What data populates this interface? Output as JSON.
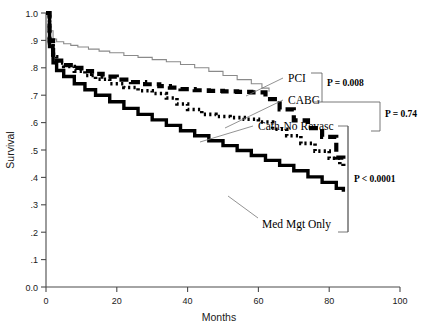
{
  "chart_data": {
    "type": "line",
    "title": "",
    "subtitle": "",
    "xlabel": "Months",
    "ylabel": "Survival",
    "xlim": [
      0,
      100
    ],
    "ylim": [
      0,
      1.0
    ],
    "grid": false,
    "legend_position": "inline-annotations",
    "xticks": [
      "0",
      "20",
      "40",
      "60",
      "80",
      "100"
    ],
    "xtick_values": [
      0,
      20,
      40,
      60,
      80,
      100
    ],
    "yticks": [
      "0.0",
      ".1",
      ".2",
      ".3",
      ".4",
      ".5",
      ".6",
      ".7",
      ".8",
      ".9",
      "1.0"
    ],
    "ytick_values": [
      0.0,
      0.1,
      0.2,
      0.3,
      0.4,
      0.5,
      0.6,
      0.7,
      0.8,
      0.9,
      1.0
    ],
    "series": [
      {
        "name": "PCI",
        "style": "thin-solid",
        "color": "#8a8a8a",
        "x": [
          0,
          1,
          2,
          3,
          5,
          7,
          9,
          12,
          15,
          18,
          22,
          26,
          30,
          34,
          38,
          42,
          46,
          50,
          54,
          58,
          61,
          63
        ],
        "values": [
          1.0,
          0.935,
          0.905,
          0.895,
          0.888,
          0.882,
          0.876,
          0.868,
          0.861,
          0.855,
          0.845,
          0.838,
          0.83,
          0.822,
          0.812,
          0.8,
          0.787,
          0.772,
          0.757,
          0.742,
          0.726,
          0.713
        ]
      },
      {
        "name": "CABG",
        "style": "thick-dashed",
        "color": "#000000",
        "x": [
          0,
          1,
          2,
          3,
          5,
          7,
          10,
          13,
          16,
          20,
          24,
          28,
          32,
          35,
          38,
          42,
          46,
          50,
          54,
          58,
          62,
          66,
          70,
          74,
          78,
          82,
          84
        ],
        "values": [
          1.0,
          0.9,
          0.848,
          0.826,
          0.81,
          0.8,
          0.788,
          0.778,
          0.768,
          0.757,
          0.748,
          0.74,
          0.733,
          0.728,
          0.722,
          0.718,
          0.716,
          0.714,
          0.712,
          0.71,
          0.686,
          0.648,
          0.608,
          0.58,
          0.548,
          0.472,
          0.442
        ]
      },
      {
        "name": "Cath-No Revasc",
        "style": "dotted",
        "color": "#000000",
        "x": [
          0,
          1,
          2,
          3,
          5,
          8,
          11,
          14,
          18,
          22,
          26,
          30,
          34,
          37,
          40,
          44,
          48,
          52,
          56,
          60,
          64,
          68,
          72,
          76,
          80,
          83
        ],
        "values": [
          1.0,
          0.892,
          0.84,
          0.818,
          0.805,
          0.788,
          0.772,
          0.758,
          0.742,
          0.728,
          0.716,
          0.706,
          0.69,
          0.668,
          0.648,
          0.63,
          0.622,
          0.618,
          0.612,
          0.602,
          0.576,
          0.552,
          0.524,
          0.496,
          0.47,
          0.448
        ]
      },
      {
        "name": "Med Mgt Only",
        "style": "thick-solid",
        "color": "#000000",
        "x": [
          0,
          1,
          2,
          3,
          5,
          8,
          11,
          14,
          18,
          22,
          26,
          30,
          34,
          38,
          42,
          46,
          50,
          54,
          58,
          62,
          66,
          70,
          74,
          78,
          82,
          84
        ],
        "values": [
          1.0,
          0.878,
          0.818,
          0.79,
          0.768,
          0.742,
          0.72,
          0.7,
          0.676,
          0.652,
          0.63,
          0.61,
          0.59,
          0.57,
          0.552,
          0.534,
          0.516,
          0.498,
          0.48,
          0.462,
          0.444,
          0.424,
          0.402,
          0.382,
          0.36,
          0.348
        ]
      }
    ],
    "annotations": [
      {
        "text": "PCI",
        "kind": "series-label"
      },
      {
        "text": "CABG",
        "kind": "series-label"
      },
      {
        "text": "Cath-No Revasc",
        "kind": "series-label"
      },
      {
        "text": "Med Mgt Only",
        "kind": "series-label"
      },
      {
        "text": "P = 0.008",
        "kind": "p-value",
        "compares": [
          "PCI",
          "CABG"
        ]
      },
      {
        "text": "P = 0.74",
        "kind": "p-value",
        "compares": [
          "PCI/CABG",
          "Cath-No Revasc"
        ]
      },
      {
        "text": "P < 0.0001",
        "kind": "p-value",
        "compares": [
          "Cath-No Revasc",
          "Med Mgt Only"
        ]
      }
    ]
  },
  "axes": {
    "y_title": "Survival",
    "x_title": "Months"
  },
  "labels": {
    "pci": "PCI",
    "cabg": "CABG",
    "cath": "Cath-No Revasc",
    "med": "Med Mgt Only",
    "p_pci_cabg": "P = 0.008",
    "p_revasc_cath": "P = 0.74",
    "p_cath_med": "P < 0.0001"
  },
  "ytick_labels": {
    "t10": "1.0",
    "t9": ".9",
    "t8": ".8",
    "t7": ".7",
    "t6": ".6",
    "t5": ".5",
    "t4": ".4",
    "t3": ".3",
    "t2": ".2",
    "t1": ".1",
    "t0": "0.0"
  },
  "xtick_labels": {
    "x0": "0",
    "x20": "20",
    "x40": "40",
    "x60": "60",
    "x80": "80",
    "x100": "100"
  }
}
